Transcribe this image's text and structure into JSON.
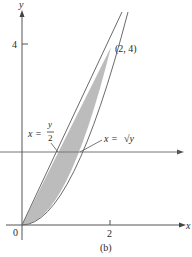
{
  "figure": {
    "caption": "(b)",
    "axes": {
      "x_label": "x",
      "y_label": "y",
      "origin_label": "0",
      "x_ticks": [
        {
          "value": 2,
          "label": "2"
        }
      ],
      "y_ticks": [
        {
          "value": 4,
          "label": "4"
        }
      ]
    },
    "curves": [
      {
        "name": "line",
        "equation_label_lhs": "x =",
        "equation_label_num": "y",
        "equation_label_den": "2",
        "equivalent": "y = 2x"
      },
      {
        "name": "parabola",
        "equation_label_lhs": "x =",
        "equation_label_rhs": "√y",
        "equivalent": "y = x^2"
      }
    ],
    "intersection_point": {
      "label": "(2, 4)",
      "x": 2,
      "y": 4
    },
    "horizontal_slice": {
      "y": 1.64
    },
    "shaded_region": "between y = x^2 and y = 2x for 0 ≤ x ≤ 2",
    "colors": {
      "shade": "#b8b8b8",
      "curve": "#6a6a6a",
      "axis": "#555555"
    }
  }
}
